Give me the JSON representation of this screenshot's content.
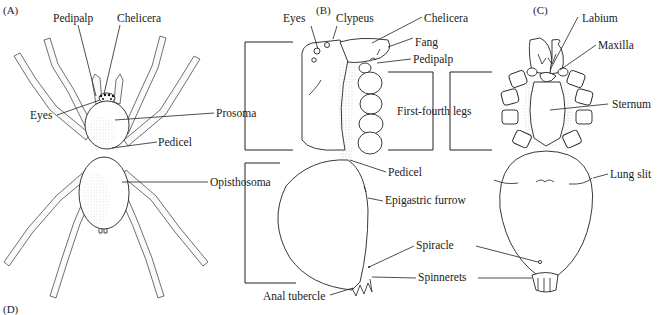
{
  "figure": {
    "panels": {
      "A": {
        "label": "(A)",
        "view": "dorsal"
      },
      "B": {
        "label": "(B)",
        "view": "lateral"
      },
      "C": {
        "label": "(C)",
        "view": "ventral"
      },
      "D": {
        "label": "(D)"
      }
    }
  },
  "labels": {
    "A": {
      "pedipalp": "Pedipalp",
      "chelicera": "Chelicera",
      "eyes": "Eyes",
      "prosoma": "Prosoma",
      "pedicel": "Pedicel",
      "opisthosoma": "Opisthosoma"
    },
    "B": {
      "eyes": "Eyes",
      "clypeus": "Clypeus",
      "chelicera": "Chelicera",
      "fang": "Fang",
      "pedipalp": "Pedipalp",
      "legs": "First-fourth legs",
      "pedicel": "Pedicel",
      "epigastric_furrow": "Epigastric furrow",
      "spiracle": "Spiracle",
      "spinnerets": "Spinnerets",
      "anal_tubercle": "Anal tubercle"
    },
    "C": {
      "labium": "Labium",
      "maxilla": "Maxilla",
      "sternum": "Sternum",
      "lung_slit": "Lung slit"
    }
  }
}
